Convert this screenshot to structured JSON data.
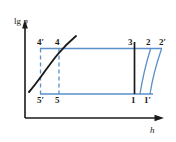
{
  "figure": {
    "type": "thermodynamic-cycle-diagram",
    "axes": {
      "y_label_prefix": "lg",
      "y_label_symbol": "p",
      "x_label_symbol": "h",
      "origin": [
        25,
        118
      ],
      "x_axis_end": [
        163,
        118
      ],
      "y_axis_top": [
        25,
        22
      ]
    },
    "colors": {
      "axis": "#1a1a1a",
      "cycle_line": "#5b8fc9",
      "dashed_line": "#5b8fc9",
      "dark_curve": "#1a1a1a",
      "background": "#ffffff"
    },
    "point_labels": [
      {
        "id": "4p",
        "text": "4′",
        "x": 40,
        "y": 48
      },
      {
        "id": "4",
        "text": "4",
        "x": 58,
        "y": 48
      },
      {
        "id": "3",
        "text": "3",
        "x": 131,
        "y": 48
      },
      {
        "id": "2",
        "text": "2",
        "x": 149,
        "y": 48
      },
      {
        "id": "2p",
        "text": "2′",
        "x": 161,
        "y": 48
      },
      {
        "id": "5p",
        "text": "5′",
        "x": 40,
        "y": 94
      },
      {
        "id": "5",
        "text": "5",
        "x": 58,
        "y": 94
      },
      {
        "id": "1",
        "text": "1",
        "x": 134,
        "y": 94
      },
      {
        "id": "1p",
        "text": "1′",
        "x": 147,
        "y": 94
      }
    ],
    "segments": {
      "top_line_desc": "isobar from 4' through 4 and 3 to 2'",
      "bottom_line_desc": "isobar from 5' through 5 and 1 to 1'",
      "compression_2_to_1": "near-vertical slightly slanted line",
      "compression_2p_to_1p": "near-vertical slightly slanted line",
      "throttle_3_to_1": "vertical dark line",
      "saturation_curve_desc": "dark rising curve crossing points 4' region"
    }
  }
}
